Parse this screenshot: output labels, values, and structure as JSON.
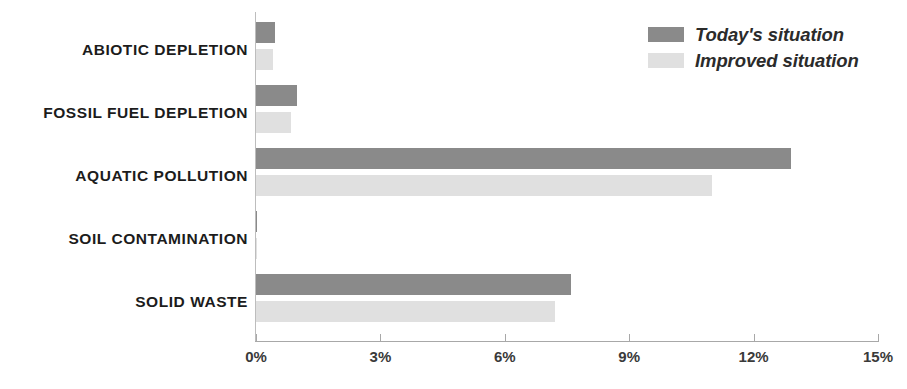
{
  "chart_data": {
    "type": "bar",
    "orientation": "horizontal",
    "title": "",
    "subtitle": "",
    "xlabel": "",
    "ylabel": "",
    "xlim": [
      0,
      15
    ],
    "xticks": [
      0,
      3,
      6,
      9,
      12,
      15
    ],
    "xtick_labels": [
      "0%",
      "3%",
      "6%",
      "9%",
      "12%",
      "15%"
    ],
    "grid": false,
    "legend_position": "top-right",
    "categories": [
      "ABIOTIC DEPLETION",
      "FOSSIL FUEL DEPLETION",
      "AQUATIC POLLUTION",
      "SOIL CONTAMINATION",
      "SOLID WASTE"
    ],
    "series": [
      {
        "name": "Today's situation",
        "color": "#8a8a8a",
        "values": [
          0.45,
          1.0,
          12.9,
          0.02,
          7.6
        ]
      },
      {
        "name": "Improved situation",
        "color": "#e0e0e0",
        "values": [
          0.42,
          0.85,
          11.0,
          0.02,
          7.2
        ]
      }
    ]
  },
  "legend": {
    "items": [
      {
        "label": "Today's situation",
        "color": "#8a8a8a"
      },
      {
        "label": "Improved situation",
        "color": "#e0e0e0"
      }
    ]
  },
  "axis": {
    "ticks": [
      {
        "value": 0,
        "label": "0%"
      },
      {
        "value": 3,
        "label": "3%"
      },
      {
        "value": 6,
        "label": "6%"
      },
      {
        "value": 9,
        "label": "9%"
      },
      {
        "value": 12,
        "label": "12%"
      },
      {
        "value": 15,
        "label": "15%"
      }
    ]
  },
  "colors": {
    "today": "#8a8a8a",
    "improved": "#e0e0e0",
    "axis": "#a8a8a8",
    "label_text": "#1c1c1c",
    "background": "#ffffff"
  }
}
